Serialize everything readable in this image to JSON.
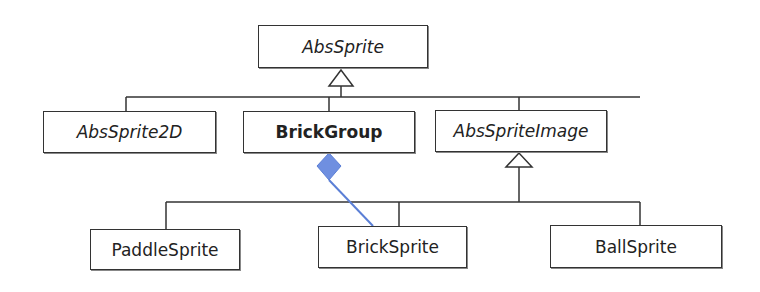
{
  "diagram": {
    "type": "UML class hierarchy",
    "classes": [
      {
        "id": "abs-sprite",
        "label": "AbsSprite",
        "style": "italic"
      },
      {
        "id": "abs-sprite-2d",
        "label": "AbsSprite2D",
        "style": "italic"
      },
      {
        "id": "brick-group",
        "label": "BrickGroup",
        "style": "bold"
      },
      {
        "id": "abs-sprite-image",
        "label": "AbsSpriteImage",
        "style": "italic"
      },
      {
        "id": "paddle-sprite",
        "label": "PaddleSprite",
        "style": "normal"
      },
      {
        "id": "brick-sprite",
        "label": "BrickSprite",
        "style": "normal"
      },
      {
        "id": "ball-sprite",
        "label": "BallSprite",
        "style": "normal"
      }
    ],
    "relations": [
      {
        "type": "inheritance",
        "from": "AbsSprite2D",
        "to": "AbsSprite"
      },
      {
        "type": "inheritance",
        "from": "BrickGroup",
        "to": "AbsSprite"
      },
      {
        "type": "inheritance",
        "from": "AbsSpriteImage",
        "to": "AbsSprite"
      },
      {
        "type": "inheritance",
        "from": "PaddleSprite",
        "to": "AbsSpriteImage"
      },
      {
        "type": "inheritance",
        "from": "BrickSprite",
        "to": "AbsSpriteImage"
      },
      {
        "type": "inheritance",
        "from": "BallSprite",
        "to": "AbsSpriteImage"
      },
      {
        "type": "composition",
        "from": "BrickGroup",
        "to": "BrickSprite",
        "color": "#5b7fd6"
      }
    ]
  }
}
